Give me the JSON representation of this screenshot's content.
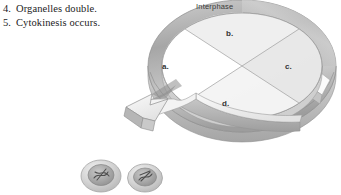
{
  "figure": {
    "background_color": "#ffffff"
  },
  "steps": {
    "items": [
      {
        "number": "4.",
        "text": "Organelles double."
      },
      {
        "number": "5.",
        "text": "Cytokinesis occurs."
      }
    ]
  },
  "wheel": {
    "ring_label": "Interphase",
    "quadrant_labels": {
      "left": "a.",
      "top": "b.",
      "right": "c.",
      "bottom": "d."
    },
    "colors": {
      "ring_light": "#d8d8d8",
      "ring_mid": "#b9b9b9",
      "ring_dark": "#9a9a9a",
      "disc_a": "#ffffff",
      "disc_b": "#f0f0f0",
      "disc_c": "#e9e9e9",
      "disc_d": "#f4f4f4",
      "outline": "#8e8e8e"
    }
  },
  "arrow": {
    "name": "cytokinesis-arrow",
    "direction": "down-left",
    "colors": {
      "face": "#ededed",
      "side": "#bdbdbd",
      "edge": "#9b9b9b"
    }
  },
  "daughter_cells": {
    "count": 2,
    "colors": {
      "membrane": "#cfcfcf",
      "cytoplasm": "#dcdcdc",
      "nucleus": "#a9a9a9",
      "chromatin": "#5a5a5a"
    }
  }
}
